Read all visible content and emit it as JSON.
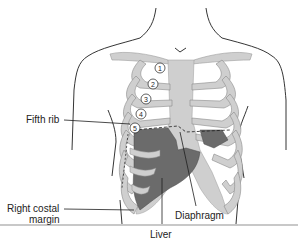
{
  "diagram": {
    "colors": {
      "outline": "#1e1e1e",
      "bone": "#cfcfcf",
      "organ": "#6b6b6b",
      "background": "#ffffff",
      "separator": "#c8c8c8"
    },
    "rib_numbers": [
      "1",
      "2",
      "3",
      "4",
      "5"
    ],
    "labels": {
      "fifth_rib": "Fifth rib",
      "right_costal_margin_line1": "Right costal",
      "right_costal_margin_line2": "margin",
      "diaphragm": "Diaphragm",
      "liver": "Liver"
    }
  }
}
